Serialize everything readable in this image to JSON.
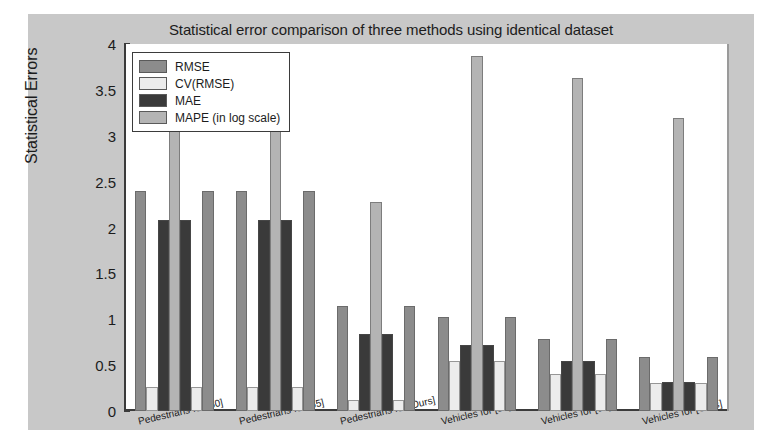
{
  "chart_data": {
    "type": "bar",
    "title": "Statistical error comparison of three methods using identical dataset",
    "xlabel": "",
    "ylabel": "Statistical Errors",
    "ylim": [
      0,
      4
    ],
    "ytick_labels": [
      "0",
      "0.5",
      "1",
      "1.5",
      "2",
      "2.5",
      "3",
      "3.5",
      "4"
    ],
    "ytick_values": [
      0,
      0.5,
      1,
      1.5,
      2,
      2.5,
      3,
      3.5,
      4
    ],
    "grid": false,
    "legend_position": "upper left",
    "bar_layout": "mirrored: RMSE, CV(RMSE), MAE, MAPE, MAE, CV(RMSE), RMSE",
    "categories": [
      "Pedestrians for [50]",
      "Pedestrians for [65]",
      "Pedestrians for [Ours]",
      "Vehicles for [50]",
      "Vehicles for [65]",
      "Vehicles for [Ours]"
    ],
    "series": [
      {
        "name": "RMSE",
        "color": "#8c8c8c",
        "values": [
          2.4,
          2.4,
          1.15,
          1.03,
          0.78,
          0.59
        ]
      },
      {
        "name": "CV(RMSE)",
        "color": "#ececec",
        "values": [
          0.26,
          0.26,
          0.12,
          0.54,
          0.4,
          0.31
        ]
      },
      {
        "name": "MAE",
        "color": "#3a3a3a",
        "values": [
          2.08,
          2.08,
          0.84,
          0.72,
          0.55,
          0.32
        ]
      },
      {
        "name": "MAPE (in log scale)",
        "color": "#b4b4b4",
        "values": [
          3.08,
          3.07,
          2.28,
          3.87,
          3.63,
          3.19
        ]
      }
    ]
  },
  "legend": {
    "items": [
      {
        "label": "RMSE"
      },
      {
        "label": "CV(RMSE)"
      },
      {
        "label": "MAE"
      },
      {
        "label": "MAPE (in log scale)"
      }
    ]
  },
  "colors": {
    "figure_background": "#c8c8c8",
    "axes_background": "#ffffff",
    "axis_line": "#3b3b3b",
    "text": "#1c1c1c"
  }
}
